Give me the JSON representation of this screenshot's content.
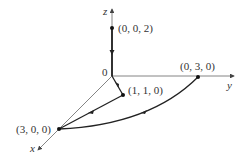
{
  "diagram": {
    "axes": {
      "x_label": "x",
      "y_label": "y",
      "z_label": "z",
      "origin_label": "0"
    },
    "points": [
      {
        "label": "(0, 0, 2)"
      },
      {
        "label": "(0, 3, 0)"
      },
      {
        "label": "(1, 1, 0)"
      },
      {
        "label": "(3, 0, 0)"
      }
    ],
    "colors": {
      "axis": "#555555",
      "path": "#222222",
      "text": "#333333"
    }
  }
}
